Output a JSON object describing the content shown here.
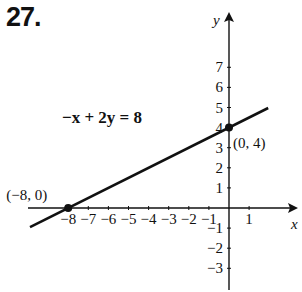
{
  "problem_number": "27.",
  "chart_data": {
    "type": "line",
    "title": "",
    "equation": "−x + 2y = 8",
    "xlabel": "x",
    "ylabel": "y",
    "xlim": [
      -9,
      3
    ],
    "ylim": [
      -4,
      9
    ],
    "x_ticks": [
      -8,
      -7,
      -6,
      -5,
      -4,
      -3,
      -2,
      -1,
      1
    ],
    "y_ticks": [
      -3,
      -2,
      -1,
      1,
      2,
      3,
      4,
      5,
      6,
      7
    ],
    "series": [
      {
        "name": "−x + 2y = 8",
        "x": [
          -10,
          2
        ],
        "y": [
          -1,
          5
        ]
      }
    ],
    "points": [
      {
        "label": "(−8, 0)",
        "x": -8,
        "y": 0
      },
      {
        "label": "(0, 4)",
        "x": 0,
        "y": 4
      }
    ],
    "grid": false
  }
}
